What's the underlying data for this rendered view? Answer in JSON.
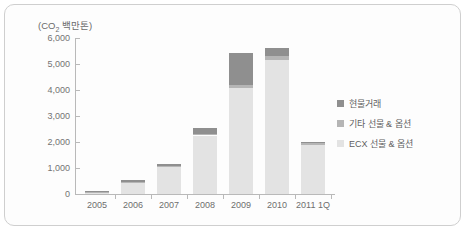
{
  "chart": {
    "unit_label": "(CO₂ 백만톤)",
    "unit_label_prefix": "(CO",
    "unit_label_sub": "2",
    "unit_label_suffix": " 백만톤)"
  },
  "colors": {
    "spot": "#8f8f8f",
    "other_futures": "#b5b5b5",
    "ecx_futures": "#e3e3e3",
    "axis": "#b9b9b9",
    "border": "#cfcfcf",
    "text": "#6e6e6e"
  },
  "legend": {
    "position": "right",
    "items": [
      {
        "label": "현물거래",
        "color": "#8f8f8f"
      },
      {
        "label": "기타 선물 & 옵션",
        "color": "#b5b5b5"
      },
      {
        "label": "ECX 선물 & 옵션",
        "color": "#e3e3e3"
      }
    ]
  },
  "chart_data": {
    "type": "bar",
    "stacked": true,
    "title": "",
    "xlabel": "",
    "ylabel": "(CO₂ 백만톤)",
    "ylim": [
      0,
      6000
    ],
    "ytick_values": [
      0,
      1000,
      2000,
      3000,
      4000,
      5000,
      6000
    ],
    "ytick_labels": [
      "0",
      "1,000",
      "2,000",
      "3,000",
      "4,000",
      "5,000",
      "6,000"
    ],
    "grid": false,
    "categories": [
      "2005",
      "2006",
      "2007",
      "2008",
      "2009",
      "2010",
      "2011 1Q"
    ],
    "series": [
      {
        "name": "ECX 선물 & 옵션",
        "color": "#e3e3e3",
        "values": [
          60,
          420,
          1020,
          2250,
          4080,
          5150,
          1900
        ]
      },
      {
        "name": "기타 선물 & 옵션",
        "color": "#b5b5b5",
        "values": [
          30,
          60,
          60,
          70,
          110,
          170,
          50
        ]
      },
      {
        "name": "현물거래",
        "color": "#8f8f8f",
        "values": [
          30,
          70,
          60,
          230,
          1220,
          310,
          60
        ]
      }
    ],
    "totals": [
      120,
      550,
      1140,
      2550,
      5410,
      5630,
      2010
    ]
  }
}
